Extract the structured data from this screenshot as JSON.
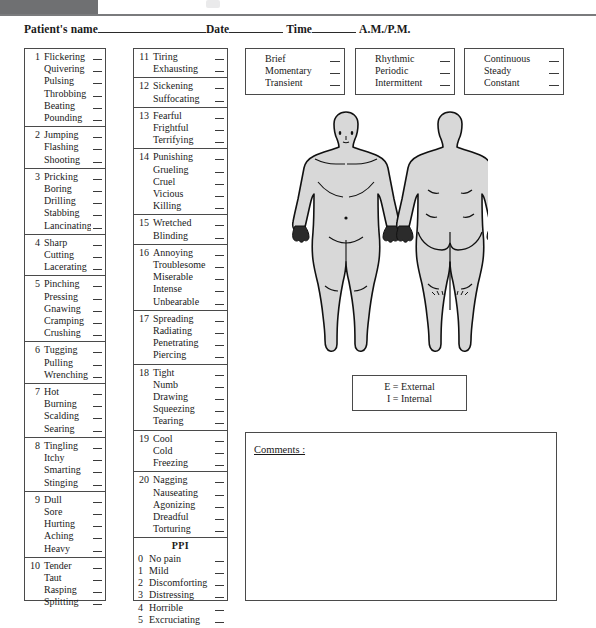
{
  "document": {
    "title": "McGill Pain Questionnaire",
    "header": {
      "patient_label": "Patient's name",
      "date_label": "Date",
      "time_label": "Time",
      "ampm_label": "A.M./P.M."
    }
  },
  "descriptor_groups_left": [
    {
      "number": "1",
      "words": [
        "Flickering",
        "Quivering",
        "Pulsing",
        "Throbbing",
        "Beating",
        "Pounding"
      ]
    },
    {
      "number": "2",
      "words": [
        "Jumping",
        "Flashing",
        "Shooting"
      ]
    },
    {
      "number": "3",
      "words": [
        "Pricking",
        "Boring",
        "Drilling",
        "Stabbing",
        "Lancinating"
      ]
    },
    {
      "number": "4",
      "words": [
        "Sharp",
        "Cutting",
        "Lacerating"
      ]
    },
    {
      "number": "5",
      "words": [
        "Pinching",
        "Pressing",
        "Gnawing",
        "Cramping",
        "Crushing"
      ]
    },
    {
      "number": "6",
      "words": [
        "Tugging",
        "Pulling",
        "Wrenching"
      ]
    },
    {
      "number": "7",
      "words": [
        "Hot",
        "Burning",
        "Scalding",
        "Searing"
      ]
    },
    {
      "number": "8",
      "words": [
        "Tingling",
        "Itchy",
        "Smarting",
        "Stinging"
      ]
    },
    {
      "number": "9",
      "words": [
        "Dull",
        "Sore",
        "Hurting",
        "Aching",
        "Heavy"
      ]
    },
    {
      "number": "10",
      "words": [
        "Tender",
        "Taut",
        "Rasping",
        "Splitting"
      ]
    }
  ],
  "descriptor_groups_right": [
    {
      "number": "11",
      "words": [
        "Tiring",
        "Exhausting"
      ]
    },
    {
      "number": "12",
      "words": [
        "Sickening",
        "Suffocating"
      ]
    },
    {
      "number": "13",
      "words": [
        "Fearful",
        "Frightful",
        "Terrifying"
      ]
    },
    {
      "number": "14",
      "words": [
        "Punishing",
        "Grueling",
        "Cruel",
        "Vicious",
        "Killing"
      ]
    },
    {
      "number": "15",
      "words": [
        "Wretched",
        "Blinding"
      ]
    },
    {
      "number": "16",
      "words": [
        "Annoying",
        "Troublesome",
        "Miserable",
        "Intense",
        "Unbearable"
      ]
    },
    {
      "number": "17",
      "words": [
        "Spreading",
        "Radiating",
        "Penetrating",
        "Piercing"
      ]
    },
    {
      "number": "18",
      "words": [
        "Tight",
        "Numb",
        "Drawing",
        "Squeezing",
        "Tearing"
      ]
    },
    {
      "number": "19",
      "words": [
        "Cool",
        "Cold",
        "Freezing"
      ]
    },
    {
      "number": "20",
      "words": [
        "Nagging",
        "Nauseating",
        "Agonizing",
        "Dreadful",
        "Torturing"
      ]
    }
  ],
  "ppi": {
    "heading": "PPI",
    "items": [
      {
        "score": "0",
        "label": "No pain"
      },
      {
        "score": "1",
        "label": "Mild"
      },
      {
        "score": "2",
        "label": "Discomforting"
      },
      {
        "score": "3",
        "label": "Distressing"
      },
      {
        "score": "4",
        "label": "Horrible"
      },
      {
        "score": "5",
        "label": "Excruciating"
      }
    ]
  },
  "temporal_boxes": [
    {
      "words": [
        "Brief",
        "Momentary",
        "Transient"
      ]
    },
    {
      "words": [
        "Rhythmic",
        "Periodic",
        "Intermittent"
      ]
    },
    {
      "words": [
        "Continuous",
        "Steady",
        "Constant"
      ]
    }
  ],
  "legend": {
    "external": "E = External",
    "internal": "I = Internal"
  },
  "comments": {
    "label": "Comments :",
    "value": ""
  },
  "body_figures": {
    "anterior_name": "anterior-body-diagram",
    "posterior_name": "posterior-body-diagram",
    "fill_color": "#d8d8d8",
    "stroke_color": "#111111"
  }
}
